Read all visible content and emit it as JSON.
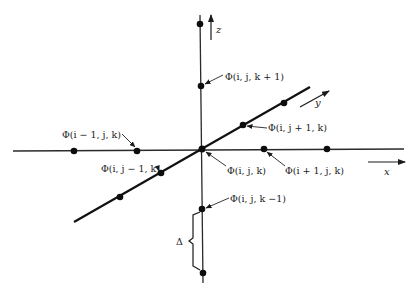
{
  "diagram": {
    "type": "3D finite-difference grid stencil",
    "axes": {
      "x": {
        "label": "x"
      },
      "y": {
        "label": "y"
      },
      "z": {
        "label": "z"
      }
    },
    "nodes": {
      "center": {
        "label": "Φ(i, j, k)"
      },
      "k_plus": {
        "label": "Φ(i, j, k + 1)"
      },
      "k_minus": {
        "label": "Φ(i, j, k −1)"
      },
      "i_minus": {
        "label": "Φ(i − 1, j, k)"
      },
      "i_plus": {
        "label": "Φ(i + 1, j, k)"
      },
      "j_minus": {
        "label": "Φ(i, j − 1, k)"
      },
      "j_plus": {
        "label": "Φ(i, j + 1, k)"
      }
    },
    "spacing": {
      "label": "Δ"
    },
    "colors": {
      "line": "#111111",
      "background": "#ffffff"
    }
  }
}
